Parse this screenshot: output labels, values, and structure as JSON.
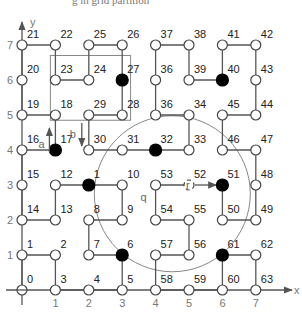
{
  "caption": "g in grid partition",
  "axes": {
    "x_label": "x",
    "y_label": "y",
    "x_ticks": [
      "1",
      "2",
      "3",
      "4",
      "5",
      "6",
      "7"
    ],
    "y_ticks": [
      "1",
      "2",
      "3",
      "4",
      "5",
      "6",
      "7"
    ]
  },
  "nodes": [
    {
      "id": "0",
      "x": 0,
      "y": 0,
      "filled": false
    },
    {
      "id": "1",
      "x": 0,
      "y": 1,
      "filled": false
    },
    {
      "id": "2",
      "x": 1,
      "y": 1,
      "filled": false
    },
    {
      "id": "3",
      "x": 1,
      "y": 0,
      "filled": false
    },
    {
      "id": "4",
      "x": 2,
      "y": 0,
      "filled": false
    },
    {
      "id": "5",
      "x": 3,
      "y": 0,
      "filled": false
    },
    {
      "id": "6",
      "x": 3,
      "y": 1,
      "filled": true
    },
    {
      "id": "7",
      "x": 2,
      "y": 1,
      "filled": false
    },
    {
      "id": "8",
      "x": 2,
      "y": 2,
      "filled": false
    },
    {
      "id": "9",
      "x": 3,
      "y": 2,
      "filled": false
    },
    {
      "id": "10",
      "x": 3,
      "y": 3,
      "filled": false
    },
    {
      "id": "1",
      "x": 2,
      "y": 3,
      "filled": true,
      "key": "11"
    },
    {
      "id": "12",
      "x": 1,
      "y": 3,
      "filled": false
    },
    {
      "id": "13",
      "x": 1,
      "y": 2,
      "filled": false
    },
    {
      "id": "14",
      "x": 0,
      "y": 2,
      "filled": false
    },
    {
      "id": "15",
      "x": 0,
      "y": 3,
      "filled": false
    },
    {
      "id": "16",
      "x": 0,
      "y": 4,
      "filled": false
    },
    {
      "id": "17",
      "x": 1,
      "y": 4,
      "filled": true
    },
    {
      "id": "18",
      "x": 1,
      "y": 5,
      "filled": false
    },
    {
      "id": "19",
      "x": 0,
      "y": 5,
      "filled": false
    },
    {
      "id": "20",
      "x": 0,
      "y": 6,
      "filled": false
    },
    {
      "id": "21",
      "x": 0,
      "y": 7,
      "filled": false
    },
    {
      "id": "22",
      "x": 1,
      "y": 7,
      "filled": false
    },
    {
      "id": "23",
      "x": 1,
      "y": 6,
      "filled": false
    },
    {
      "id": "24",
      "x": 2,
      "y": 6,
      "filled": false
    },
    {
      "id": "25",
      "x": 2,
      "y": 7,
      "filled": false
    },
    {
      "id": "26",
      "x": 3,
      "y": 7,
      "filled": false
    },
    {
      "id": "27",
      "x": 3,
      "y": 6,
      "filled": true
    },
    {
      "id": "28",
      "x": 3,
      "y": 5,
      "filled": false
    },
    {
      "id": "29",
      "x": 2,
      "y": 5,
      "filled": false
    },
    {
      "id": "30",
      "x": 2,
      "y": 4,
      "filled": false
    },
    {
      "id": "31",
      "x": 3,
      "y": 4,
      "filled": false
    },
    {
      "id": "32",
      "x": 4,
      "y": 4,
      "filled": true
    },
    {
      "id": "33",
      "x": 5,
      "y": 4,
      "filled": false
    },
    {
      "id": "34",
      "x": 5,
      "y": 5,
      "filled": false
    },
    {
      "id": "36",
      "x": 4,
      "y": 5,
      "filled": false,
      "key": "35"
    },
    {
      "id": "36",
      "x": 4,
      "y": 6,
      "filled": false
    },
    {
      "id": "37",
      "x": 4,
      "y": 7,
      "filled": false
    },
    {
      "id": "38",
      "x": 5,
      "y": 7,
      "filled": false
    },
    {
      "id": "39",
      "x": 5,
      "y": 6,
      "filled": false
    },
    {
      "id": "40",
      "x": 6,
      "y": 6,
      "filled": true
    },
    {
      "id": "41",
      "x": 6,
      "y": 7,
      "filled": false
    },
    {
      "id": "42",
      "x": 7,
      "y": 7,
      "filled": false
    },
    {
      "id": "43",
      "x": 7,
      "y": 6,
      "filled": false
    },
    {
      "id": "44",
      "x": 7,
      "y": 5,
      "filled": false
    },
    {
      "id": "45",
      "x": 6,
      "y": 5,
      "filled": false
    },
    {
      "id": "46",
      "x": 6,
      "y": 4,
      "filled": false
    },
    {
      "id": "47",
      "x": 7,
      "y": 4,
      "filled": false
    },
    {
      "id": "48",
      "x": 7,
      "y": 3,
      "filled": false
    },
    {
      "id": "49",
      "x": 7,
      "y": 2,
      "filled": false
    },
    {
      "id": "50",
      "x": 6,
      "y": 2,
      "filled": false
    },
    {
      "id": "51",
      "x": 6,
      "y": 3,
      "filled": true
    },
    {
      "id": "52",
      "x": 5,
      "y": 3,
      "filled": false,
      "dashed": true
    },
    {
      "id": "53",
      "x": 4,
      "y": 3,
      "filled": false
    },
    {
      "id": "54",
      "x": 4,
      "y": 2,
      "filled": false
    },
    {
      "id": "55",
      "x": 5,
      "y": 2,
      "filled": false
    },
    {
      "id": "56",
      "x": 5,
      "y": 1,
      "filled": false
    },
    {
      "id": "57",
      "x": 4,
      "y": 1,
      "filled": false
    },
    {
      "id": "58",
      "x": 4,
      "y": 0,
      "filled": false
    },
    {
      "id": "59",
      "x": 5,
      "y": 0,
      "filled": false
    },
    {
      "id": "60",
      "x": 6,
      "y": 0,
      "filled": false
    },
    {
      "id": "61",
      "x": 6,
      "y": 1,
      "filled": true
    },
    {
      "id": "62",
      "x": 7,
      "y": 1,
      "filled": false
    },
    {
      "id": "63",
      "x": 7,
      "y": 0,
      "filled": false
    }
  ],
  "path_edges": [
    [
      [
        0,
        0
      ],
      [
        0,
        1
      ]
    ],
    [
      [
        0,
        1
      ],
      [
        1,
        1
      ]
    ],
    [
      [
        1,
        1
      ],
      [
        1,
        0
      ]
    ],
    [
      [
        1,
        0
      ],
      [
        2,
        0
      ]
    ],
    [
      [
        2,
        0
      ],
      [
        3,
        0
      ]
    ],
    [
      [
        3,
        0
      ],
      [
        3,
        1
      ]
    ],
    [
      [
        3,
        1
      ],
      [
        2,
        1
      ]
    ],
    [
      [
        2,
        1
      ],
      [
        2,
        2
      ]
    ],
    [
      [
        2,
        2
      ],
      [
        3,
        2
      ]
    ],
    [
      [
        3,
        2
      ],
      [
        3,
        3
      ]
    ],
    [
      [
        3,
        3
      ],
      [
        2,
        3
      ]
    ],
    [
      [
        2,
        3
      ],
      [
        1,
        3
      ]
    ],
    [
      [
        1,
        3
      ],
      [
        1,
        2
      ]
    ],
    [
      [
        1,
        2
      ],
      [
        0,
        2
      ]
    ],
    [
      [
        0,
        2
      ],
      [
        0,
        3
      ]
    ],
    [
      [
        0,
        3
      ],
      [
        0,
        4
      ]
    ],
    [
      [
        0,
        4
      ],
      [
        1,
        4
      ]
    ],
    [
      [
        1,
        4
      ],
      [
        1,
        5
      ]
    ],
    [
      [
        1,
        5
      ],
      [
        0,
        5
      ]
    ],
    [
      [
        0,
        5
      ],
      [
        0,
        6
      ]
    ],
    [
      [
        0,
        6
      ],
      [
        0,
        7
      ]
    ],
    [
      [
        0,
        7
      ],
      [
        1,
        7
      ]
    ],
    [
      [
        1,
        7
      ],
      [
        1,
        6
      ]
    ],
    [
      [
        1,
        6
      ],
      [
        2,
        6
      ]
    ],
    [
      [
        2,
        6
      ],
      [
        2,
        7
      ]
    ],
    [
      [
        2,
        7
      ],
      [
        3,
        7
      ]
    ],
    [
      [
        3,
        7
      ],
      [
        3,
        6
      ]
    ],
    [
      [
        3,
        6
      ],
      [
        3,
        5
      ]
    ],
    [
      [
        3,
        5
      ],
      [
        2,
        5
      ]
    ],
    [
      [
        2,
        5
      ],
      [
        2,
        4
      ]
    ],
    [
      [
        2,
        4
      ],
      [
        3,
        4
      ]
    ],
    [
      [
        3,
        4
      ],
      [
        4,
        4
      ]
    ],
    [
      [
        4,
        4
      ],
      [
        5,
        4
      ]
    ],
    [
      [
        5,
        4
      ],
      [
        5,
        5
      ]
    ],
    [
      [
        5,
        5
      ],
      [
        4,
        5
      ]
    ],
    [
      [
        4,
        5
      ],
      [
        4,
        6
      ]
    ],
    [
      [
        4,
        6
      ],
      [
        4,
        7
      ]
    ],
    [
      [
        4,
        7
      ],
      [
        5,
        7
      ]
    ],
    [
      [
        5,
        7
      ],
      [
        5,
        6
      ]
    ],
    [
      [
        5,
        6
      ],
      [
        6,
        6
      ]
    ],
    [
      [
        6,
        6
      ],
      [
        6,
        7
      ]
    ],
    [
      [
        6,
        7
      ],
      [
        7,
        7
      ]
    ],
    [
      [
        7,
        7
      ],
      [
        7,
        6
      ]
    ],
    [
      [
        7,
        6
      ],
      [
        7,
        5
      ]
    ],
    [
      [
        7,
        5
      ],
      [
        6,
        5
      ]
    ],
    [
      [
        6,
        5
      ],
      [
        6,
        4
      ]
    ],
    [
      [
        6,
        4
      ],
      [
        7,
        4
      ]
    ],
    [
      [
        7,
        4
      ],
      [
        7,
        3
      ]
    ],
    [
      [
        7,
        3
      ],
      [
        7,
        2
      ]
    ],
    [
      [
        7,
        2
      ],
      [
        6,
        2
      ]
    ],
    [
      [
        6,
        2
      ],
      [
        6,
        3
      ]
    ],
    [
      [
        5,
        3
      ],
      [
        4,
        3
      ]
    ],
    [
      [
        4,
        3
      ],
      [
        4,
        2
      ]
    ],
    [
      [
        4,
        2
      ],
      [
        5,
        2
      ]
    ],
    [
      [
        5,
        2
      ],
      [
        5,
        1
      ]
    ],
    [
      [
        5,
        1
      ],
      [
        4,
        1
      ]
    ],
    [
      [
        4,
        1
      ],
      [
        4,
        0
      ]
    ],
    [
      [
        4,
        0
      ],
      [
        5,
        0
      ]
    ],
    [
      [
        5,
        0
      ],
      [
        6,
        0
      ]
    ],
    [
      [
        6,
        0
      ],
      [
        6,
        1
      ]
    ],
    [
      [
        6,
        1
      ],
      [
        7,
        1
      ]
    ],
    [
      [
        7,
        1
      ],
      [
        7,
        0
      ]
    ]
  ],
  "arrow_edge": {
    "from": [
      5,
      3
    ],
    "to": [
      6,
      3
    ]
  },
  "annotations": {
    "a": "a",
    "b": "b",
    "q": "q",
    "r": "r"
  },
  "region_rect": {
    "x0": 0.85,
    "y0": 4.85,
    "x1": 3.25,
    "y1": 6.7
  },
  "circle": {
    "cx": 4.5,
    "cy": 2.75,
    "r_px": 78
  }
}
